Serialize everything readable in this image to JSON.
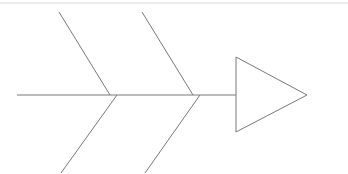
{
  "diagram": {
    "type": "fishbone",
    "alt_name": "Ishikawa cause-and-effect diagram",
    "title": "",
    "labels": [],
    "background_color": "#ffffff",
    "stroke_color": "#787878",
    "stroke_width": 1,
    "top_rule_color": "#d9d9d9",
    "canvas": {
      "width": 348,
      "height": 174
    },
    "spine": {
      "name": "spine",
      "x1": 17,
      "y1": 95,
      "x2": 236,
      "y2": 95,
      "label": ""
    },
    "top_rule": {
      "name": "top-rule",
      "x1": 0,
      "y1": 3,
      "x2": 348,
      "y2": 3
    },
    "head": {
      "name": "fish-head-triangle",
      "points": "236,57 307,95 236,132",
      "label": ""
    },
    "ribs": [
      {
        "name": "rib-1",
        "upper": {
          "x1": 59,
          "y1": 12,
          "x2": 110,
          "y2": 95,
          "label": ""
        },
        "lower": {
          "x1": 117,
          "y1": 95,
          "x2": 61,
          "y2": 173,
          "label": ""
        }
      },
      {
        "name": "rib-2",
        "upper": {
          "x1": 142,
          "y1": 12,
          "x2": 193,
          "y2": 95,
          "label": ""
        },
        "lower": {
          "x1": 200,
          "y1": 95,
          "x2": 145,
          "y2": 173,
          "label": ""
        }
      }
    ]
  }
}
